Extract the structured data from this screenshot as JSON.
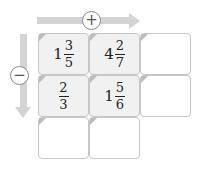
{
  "operators": {
    "horizontal": {
      "symbol": "+",
      "icon": "plus-circle-icon",
      "direction": "right"
    },
    "vertical": {
      "symbol": "−",
      "icon": "minus-circle-icon",
      "direction": "down"
    }
  },
  "colors": {
    "arrow": "#d4d4d4",
    "cell_filled": "#f1f1f1",
    "cell_border": "#c6c6c6"
  },
  "grid": {
    "rows": [
      [
        {
          "whole": "1",
          "num": "3",
          "den": "5"
        },
        {
          "whole": "4",
          "num": "2",
          "den": "7"
        },
        null
      ],
      [
        {
          "whole": "",
          "num": "2",
          "den": "3"
        },
        {
          "whole": "1",
          "num": "5",
          "den": "6"
        },
        null
      ],
      [
        null,
        null
      ]
    ]
  }
}
